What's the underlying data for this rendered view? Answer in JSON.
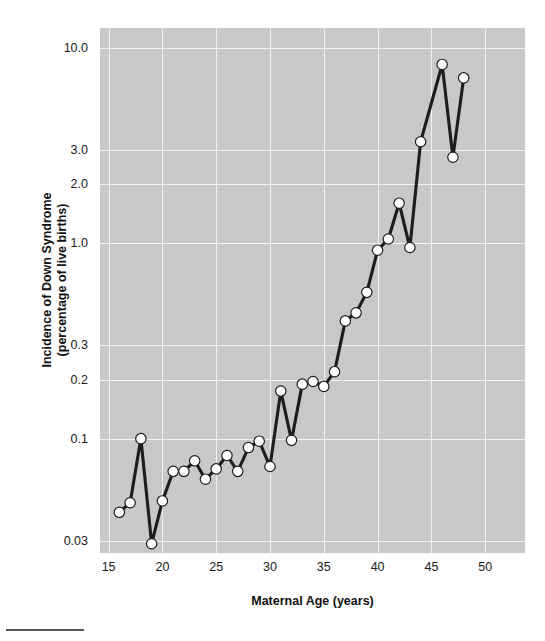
{
  "chart_data": {
    "type": "line",
    "title": "",
    "xlabel": "Maternal Age (years)",
    "ylabel_line1": "Incidence of Down Syndrome",
    "ylabel_line2": "(percentage of live births)",
    "yscale": "log",
    "xlim": [
      14.2,
      53.7
    ],
    "ylim": [
      0.026,
      12.6
    ],
    "grid": true,
    "legend": "none",
    "marker": "circle-white-filled",
    "line_color": "#1d1d1d",
    "marker_face_color": "#ffffff",
    "marker_edge_color": "#1d1d1d",
    "panel_color": "#c8c8c8",
    "grid_color": "#f2f2f2",
    "xticks": [
      15,
      20,
      25,
      30,
      35,
      40,
      45,
      50
    ],
    "xtick_labels": [
      "15",
      "20",
      "25",
      "30",
      "35",
      "40",
      "45",
      "50"
    ],
    "yticks": [
      0.03,
      0.1,
      0.2,
      0.3,
      1.0,
      2.0,
      3.0,
      10.0
    ],
    "ytick_labels": [
      "0.03",
      "0.1",
      "0.2",
      "0.3",
      "1.0",
      "2.0",
      "3.0",
      "10.0"
    ],
    "x": [
      16,
      17,
      18,
      19,
      20,
      21,
      22,
      23,
      24,
      25,
      26,
      27,
      28,
      29,
      30,
      31,
      32,
      33,
      34,
      35,
      36,
      37,
      38,
      39,
      40,
      41,
      42,
      43,
      44,
      46,
      47,
      48
    ],
    "y": [
      0.042,
      0.047,
      0.1,
      0.029,
      0.048,
      0.068,
      0.068,
      0.077,
      0.062,
      0.07,
      0.082,
      0.068,
      0.09,
      0.097,
      0.072,
      0.175,
      0.098,
      0.19,
      0.196,
      0.185,
      0.22,
      0.4,
      0.44,
      0.56,
      0.92,
      1.05,
      1.6,
      0.95,
      3.3,
      8.2,
      2.75,
      7.0
    ],
    "points": [
      {
        "age": 16,
        "incidence": 0.042
      },
      {
        "age": 17,
        "incidence": 0.047
      },
      {
        "age": 18,
        "incidence": 0.1
      },
      {
        "age": 19,
        "incidence": 0.029
      },
      {
        "age": 20,
        "incidence": 0.048
      },
      {
        "age": 21,
        "incidence": 0.068
      },
      {
        "age": 22,
        "incidence": 0.068
      },
      {
        "age": 23,
        "incidence": 0.077
      },
      {
        "age": 24,
        "incidence": 0.062
      },
      {
        "age": 25,
        "incidence": 0.07
      },
      {
        "age": 26,
        "incidence": 0.082
      },
      {
        "age": 27,
        "incidence": 0.068
      },
      {
        "age": 28,
        "incidence": 0.09
      },
      {
        "age": 29,
        "incidence": 0.097
      },
      {
        "age": 30,
        "incidence": 0.072
      },
      {
        "age": 31,
        "incidence": 0.175
      },
      {
        "age": 32,
        "incidence": 0.098
      },
      {
        "age": 33,
        "incidence": 0.19
      },
      {
        "age": 34,
        "incidence": 0.196
      },
      {
        "age": 35,
        "incidence": 0.185
      },
      {
        "age": 36,
        "incidence": 0.22
      },
      {
        "age": 37,
        "incidence": 0.4
      },
      {
        "age": 38,
        "incidence": 0.44
      },
      {
        "age": 39,
        "incidence": 0.56
      },
      {
        "age": 40,
        "incidence": 0.92
      },
      {
        "age": 41,
        "incidence": 1.05
      },
      {
        "age": 42,
        "incidence": 1.6
      },
      {
        "age": 43,
        "incidence": 0.95
      },
      {
        "age": 44,
        "incidence": 3.3
      },
      {
        "age": 46,
        "incidence": 8.2
      },
      {
        "age": 47,
        "incidence": 2.75
      },
      {
        "age": 48,
        "incidence": 7.0
      }
    ]
  }
}
